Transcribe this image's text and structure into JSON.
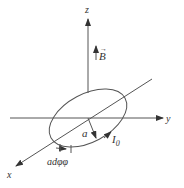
{
  "diagram": {
    "axes": {
      "z_label": "z",
      "y_label": "y",
      "x_label": "x"
    },
    "field_label": "B",
    "field_vector_mark": "→",
    "radius_label": "a",
    "current_label": "I",
    "current_subscript": "0",
    "element_label": "adφφ",
    "colors": {
      "stroke": "#555555",
      "text": "#333333",
      "background": "#ffffff"
    }
  }
}
